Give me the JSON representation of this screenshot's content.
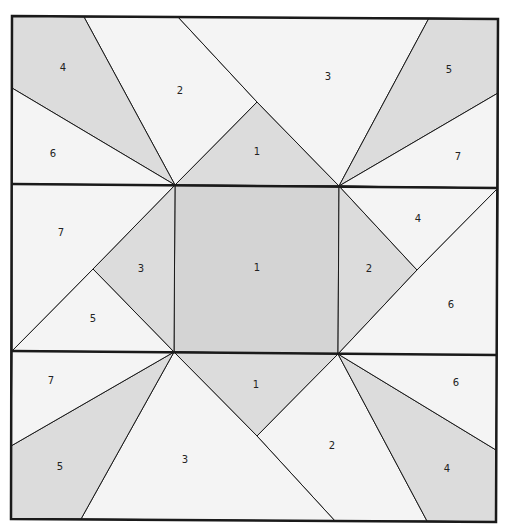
{
  "diagram": {
    "type": "quilt-block-foundation-pattern",
    "colors": {
      "light": "#f4f4f4",
      "medium": "#dcdcdc",
      "center": "#d4d4d4",
      "line": "#1a1a1a"
    },
    "rows": [
      {
        "name": "top-row",
        "pieces": [
          {
            "label": "1",
            "shade": "medium",
            "points": "175,185 257,102 339,186",
            "lx": 257,
            "ly": 152
          },
          {
            "label": "2",
            "shade": "light",
            "points": "84,17 178,17 257,102 175,185",
            "lx": 180,
            "ly": 91
          },
          {
            "label": "3",
            "shade": "light",
            "points": "178,17 429,18 339,186 257,102",
            "lx": 328,
            "ly": 77
          },
          {
            "label": "4",
            "shade": "medium",
            "points": "12,16 84,17 175,185 12,88",
            "lx": 63,
            "ly": 68
          },
          {
            "label": "5",
            "shade": "medium",
            "points": "429,18 498,19 498,93 339,186",
            "lx": 449,
            "ly": 70
          },
          {
            "label": "6",
            "shade": "light",
            "points": "12,88 175,185 12,184",
            "lx": 53,
            "ly": 154
          },
          {
            "label": "7",
            "shade": "light",
            "points": "498,93 498,188 339,186",
            "lx": 458,
            "ly": 157
          }
        ]
      },
      {
        "name": "middle-row",
        "pieces": [
          {
            "label": "1",
            "shade": "center",
            "points": "175,185 339,186 338,354 174,352",
            "lx": 257,
            "ly": 268
          },
          {
            "label": "2",
            "shade": "medium",
            "points": "339,186 417,270 338,354",
            "lx": 369,
            "ly": 269
          },
          {
            "label": "3",
            "shade": "medium",
            "points": "175,185 174,352 93,269",
            "lx": 141,
            "ly": 269
          },
          {
            "label": "4",
            "shade": "light",
            "points": "339,186 498,188 417,270",
            "lx": 418,
            "ly": 219
          },
          {
            "label": "5",
            "shade": "light",
            "points": "93,269 174,352 12,351",
            "lx": 93,
            "ly": 319
          },
          {
            "label": "6",
            "shade": "light",
            "points": "498,188 497,355 338,354 417,270",
            "lx": 451,
            "ly": 305
          },
          {
            "label": "7",
            "shade": "light",
            "points": "12,184 175,185 93,269 12,351",
            "lx": 61,
            "ly": 233
          }
        ]
      },
      {
        "name": "bottom-row",
        "pieces": [
          {
            "label": "1",
            "shade": "medium",
            "points": "174,352 338,354 257,436",
            "lx": 256,
            "ly": 385
          },
          {
            "label": "2",
            "shade": "light",
            "points": "257,436 338,354 427,521 335,521",
            "lx": 332,
            "ly": 446
          },
          {
            "label": "3",
            "shade": "light",
            "points": "174,352 257,436 335,521 81,519",
            "lx": 185,
            "ly": 460
          },
          {
            "label": "4",
            "shade": "medium",
            "points": "338,354 496,450 496,522 427,521",
            "lx": 447,
            "ly": 469
          },
          {
            "label": "5",
            "shade": "medium",
            "points": "174,352 81,519 11,519 11,446",
            "lx": 60,
            "ly": 467
          },
          {
            "label": "6",
            "shade": "light",
            "points": "338,354 497,355 496,450",
            "lx": 456,
            "ly": 383
          },
          {
            "label": "7",
            "shade": "light",
            "points": "12,351 174,352 11,446",
            "lx": 51,
            "ly": 381
          }
        ]
      }
    ],
    "outline": {
      "outer": "12,16 498,19 496,522 11,519",
      "divider_top": {
        "x1": 12,
        "y1": 184,
        "x2": 498,
        "y2": 188
      },
      "divider_bottom": {
        "x1": 12,
        "y1": 351,
        "x2": 497,
        "y2": 355
      }
    }
  }
}
